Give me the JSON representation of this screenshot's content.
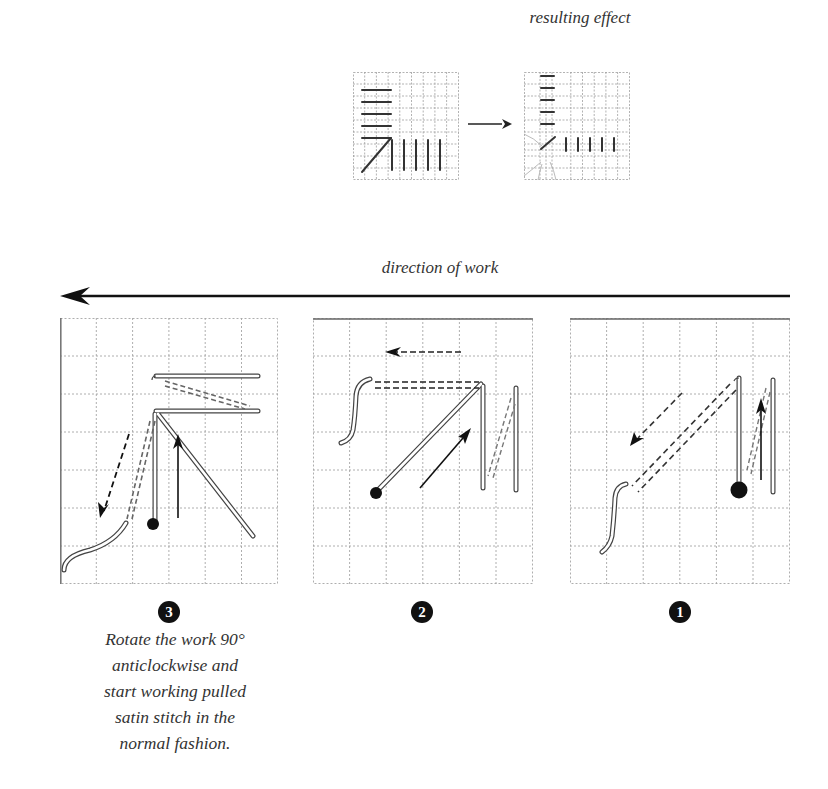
{
  "header": {
    "result_label": "resulting effect",
    "direction_label": "direction of work"
  },
  "icons": {
    "direction_arrow": "left-arrow",
    "transform_arrow": "right-arrow"
  },
  "colors": {
    "grid": "#9a9a9a",
    "stitch": "#333333",
    "thread_outline": "#444444",
    "background": "#ffffff"
  },
  "steps": [
    {
      "number": "3",
      "label": "step-3",
      "description": "Rotate the work 90° anticlockwise and start working pulled satin stitch in the normal fashion."
    },
    {
      "number": "2",
      "label": "step-2",
      "description": ""
    },
    {
      "number": "1",
      "label": "step-1",
      "description": ""
    }
  ],
  "step_description_lines": [
    "Rotate the work 90°",
    "anticlockwise and",
    "start working pulled",
    "satin stitch in the",
    "normal fashion."
  ]
}
